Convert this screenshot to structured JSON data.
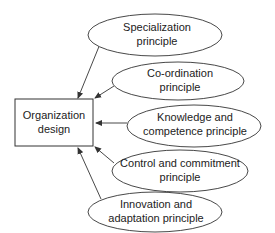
{
  "diagram": {
    "center": {
      "line1": "Organization",
      "line2": "design"
    },
    "principles": [
      {
        "line1": "Specialization",
        "line2": "principle"
      },
      {
        "line1": "Co-ordination",
        "line2": "principle"
      },
      {
        "line1": "Knowledge and",
        "line2": "competence principle"
      },
      {
        "line1": "Control and commitment",
        "line2": "principle"
      },
      {
        "line1": "Innovation and",
        "line2": "adaptation principle"
      }
    ],
    "colors": {
      "stroke": "#333333",
      "text": "#222222",
      "background": "#ffffff"
    }
  }
}
